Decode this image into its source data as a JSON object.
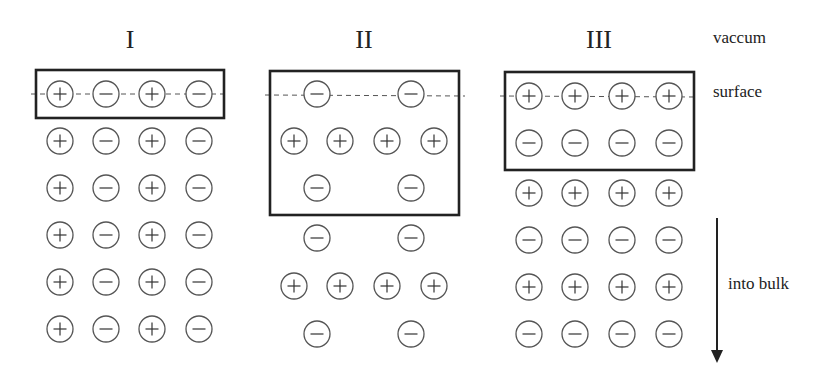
{
  "diagram": {
    "panels": [
      {
        "label": "I",
        "label_x": 130,
        "box": {
          "x": 36,
          "y": 70,
          "w": 188,
          "h": 48
        },
        "columns": [
          60,
          106,
          152,
          199
        ],
        "rows": [
          {
            "y": 94,
            "charges": [
              "+",
              "-",
              "+",
              "-"
            ]
          },
          {
            "y": 141,
            "charges": [
              "+",
              "-",
              "+",
              "-"
            ]
          },
          {
            "y": 188,
            "charges": [
              "+",
              "-",
              "+",
              "-"
            ]
          },
          {
            "y": 235,
            "charges": [
              "+",
              "-",
              "+",
              "-"
            ]
          },
          {
            "y": 282,
            "charges": [
              "+",
              "-",
              "+",
              "-"
            ]
          },
          {
            "y": 329,
            "charges": [
              "+",
              "-",
              "+",
              "-"
            ]
          }
        ]
      },
      {
        "label": "II",
        "label_x": 364,
        "box": {
          "x": 270,
          "y": 71,
          "w": 189,
          "h": 144
        },
        "columns": [
          294,
          317,
          340,
          387,
          411,
          434
        ],
        "rows": [
          {
            "y": 94,
            "ions": [
              {
                "x": 317,
                "c": "-"
              },
              {
                "x": 411,
                "c": "-"
              }
            ]
          },
          {
            "y": 141,
            "ions": [
              {
                "x": 294,
                "c": "+"
              },
              {
                "x": 340,
                "c": "+"
              },
              {
                "x": 387,
                "c": "+"
              },
              {
                "x": 434,
                "c": "+"
              }
            ]
          },
          {
            "y": 188,
            "ions": [
              {
                "x": 317,
                "c": "-"
              },
              {
                "x": 411,
                "c": "-"
              }
            ]
          },
          {
            "y": 238,
            "ions": [
              {
                "x": 317,
                "c": "-"
              },
              {
                "x": 411,
                "c": "-"
              }
            ]
          },
          {
            "y": 286,
            "ions": [
              {
                "x": 294,
                "c": "+"
              },
              {
                "x": 340,
                "c": "+"
              },
              {
                "x": 387,
                "c": "+"
              },
              {
                "x": 434,
                "c": "+"
              }
            ]
          },
          {
            "y": 334,
            "ions": [
              {
                "x": 317,
                "c": "-"
              },
              {
                "x": 411,
                "c": "-"
              }
            ]
          }
        ]
      },
      {
        "label": "III",
        "label_x": 599,
        "box": {
          "x": 505,
          "y": 72,
          "w": 189,
          "h": 98
        },
        "columns": [
          529,
          575,
          622,
          669
        ],
        "rows": [
          {
            "y": 96,
            "charges": [
              "+",
              "+",
              "+",
              "+"
            ]
          },
          {
            "y": 143,
            "charges": [
              "-",
              "-",
              "-",
              "-"
            ]
          },
          {
            "y": 193,
            "charges": [
              "+",
              "+",
              "+",
              "+"
            ]
          },
          {
            "y": 240,
            "charges": [
              "-",
              "-",
              "-",
              "-"
            ]
          },
          {
            "y": 287,
            "charges": [
              "+",
              "+",
              "+",
              "+"
            ]
          },
          {
            "y": 334,
            "charges": [
              "-",
              "-",
              "-",
              "-"
            ]
          }
        ]
      }
    ],
    "labels": {
      "vacuum": "vaccum",
      "surface": "surface",
      "bulk": "into bulk"
    },
    "surface_line_y": 95,
    "arrow": {
      "x": 717,
      "y1": 218,
      "y2": 362
    },
    "colors": {
      "stroke": "#222222",
      "circle": "#555555",
      "background": "#ffffff"
    }
  }
}
